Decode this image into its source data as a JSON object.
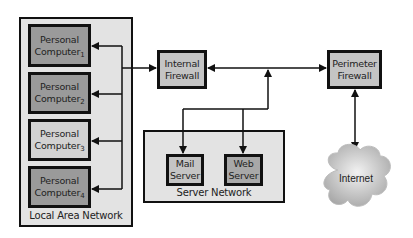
{
  "diagram": {
    "lan": {
      "label": "Local Area Network",
      "computers": [
        {
          "line1": "Personal",
          "line2": "Computer",
          "sub": "1",
          "fill": "#9a9a9a"
        },
        {
          "line1": "Personal",
          "line2": "Computer",
          "sub": "2",
          "fill": "#9a9a9a"
        },
        {
          "line1": "Personal",
          "line2": "Computer",
          "sub": "3",
          "fill": "#d2d2d2"
        },
        {
          "line1": "Personal",
          "line2": "Computer",
          "sub": "4",
          "fill": "#9a9a9a"
        }
      ]
    },
    "internal_firewall": {
      "line1": "Internal",
      "line2": "Firewall",
      "fill": "#c4c4c4"
    },
    "perimeter_firewall": {
      "line1": "Perimeter",
      "line2": "Firewall",
      "fill": "#c4c4c4"
    },
    "server_network": {
      "label": "Server Network",
      "servers": [
        {
          "line1": "Mail",
          "line2": "Server",
          "fill": "#c4c4c4"
        },
        {
          "line1": "Web",
          "line2": "Server",
          "fill": "#a8a8a8"
        }
      ]
    },
    "internet": {
      "label": "Internet"
    },
    "colors": {
      "line": "#111111",
      "container_fill": "#e3e3e3",
      "cloud_fill": "#b8b8b8"
    }
  }
}
